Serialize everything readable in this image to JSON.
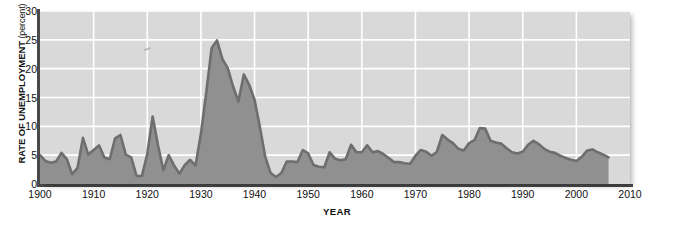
{
  "chart_data": {
    "type": "area",
    "title": "",
    "xlabel": "YEAR",
    "ylabel": "RATE OF UNEMPLOYMENT (percent)",
    "ylabel_main": "RATE OF UNEMPLOYMENT",
    "ylabel_unit": "(percent)",
    "xlim": [
      1900,
      2010
    ],
    "ylim": [
      0,
      30
    ],
    "grid": true,
    "legend": "none",
    "xticks": [
      1900,
      1910,
      1920,
      1930,
      1940,
      1950,
      1960,
      1970,
      1980,
      1990,
      2000,
      2010
    ],
    "yticks": [
      0,
      5,
      10,
      15,
      20,
      25,
      30
    ],
    "colors": {
      "plot_background": "#d9d9d9",
      "gridline": "#ffffff",
      "area_fill": "#909090",
      "series_line": "#6e6e6e",
      "axis": "#4a4a4a",
      "text": "#111111"
    },
    "series": [
      {
        "name": "Rate of unemployment",
        "x": [
          1900,
          1901,
          1902,
          1903,
          1904,
          1905,
          1906,
          1907,
          1908,
          1909,
          1910,
          1911,
          1912,
          1913,
          1914,
          1915,
          1916,
          1917,
          1918,
          1919,
          1920,
          1921,
          1922,
          1923,
          1924,
          1925,
          1926,
          1927,
          1928,
          1929,
          1930,
          1931,
          1932,
          1933,
          1934,
          1935,
          1936,
          1937,
          1938,
          1939,
          1940,
          1941,
          1942,
          1943,
          1944,
          1945,
          1946,
          1947,
          1948,
          1949,
          1950,
          1951,
          1952,
          1953,
          1954,
          1955,
          1956,
          1957,
          1958,
          1959,
          1960,
          1961,
          1962,
          1963,
          1964,
          1965,
          1966,
          1967,
          1968,
          1969,
          1970,
          1971,
          1972,
          1973,
          1974,
          1975,
          1976,
          1977,
          1978,
          1979,
          1980,
          1981,
          1982,
          1983,
          1984,
          1985,
          1986,
          1987,
          1988,
          1989,
          1990,
          1991,
          1992,
          1993,
          1994,
          1995,
          1996,
          1997,
          1998,
          1999,
          2000,
          2001,
          2002,
          2003,
          2004,
          2005,
          2006
        ],
        "values": [
          5.0,
          4.0,
          3.7,
          3.9,
          5.4,
          4.3,
          1.7,
          2.8,
          8.0,
          5.1,
          5.9,
          6.7,
          4.6,
          4.3,
          7.9,
          8.5,
          5.1,
          4.6,
          1.4,
          1.4,
          5.2,
          11.7,
          6.7,
          2.4,
          5.0,
          3.2,
          1.8,
          3.3,
          4.2,
          3.2,
          8.7,
          15.9,
          23.6,
          24.9,
          21.7,
          20.1,
          16.9,
          14.3,
          19.0,
          17.2,
          14.6,
          9.9,
          4.7,
          1.9,
          1.2,
          1.9,
          3.9,
          3.9,
          3.8,
          5.9,
          5.3,
          3.3,
          3.0,
          2.9,
          5.5,
          4.4,
          4.1,
          4.3,
          6.8,
          5.5,
          5.5,
          6.7,
          5.5,
          5.7,
          5.2,
          4.5,
          3.8,
          3.8,
          3.6,
          3.5,
          4.9,
          5.9,
          5.6,
          4.9,
          5.6,
          8.5,
          7.7,
          7.1,
          6.1,
          5.8,
          7.1,
          7.6,
          9.7,
          9.6,
          7.5,
          7.2,
          7.0,
          6.2,
          5.5,
          5.3,
          5.6,
          6.8,
          7.5,
          6.9,
          6.1,
          5.6,
          5.4,
          4.9,
          4.5,
          4.2,
          4.0,
          4.7,
          5.8,
          6.0,
          5.5,
          5.1,
          4.6
        ]
      }
    ]
  }
}
